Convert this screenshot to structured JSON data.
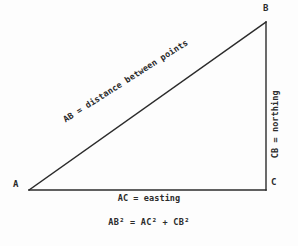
{
  "diagram": {
    "background_color": "#fdfdfd",
    "stroke_color": "#2b2b2b",
    "text_color": "#2b2b2b",
    "vertices": {
      "a": {
        "label": "A",
        "x": 29,
        "y": 190
      },
      "b": {
        "label": "B",
        "x": 266,
        "y": 22
      },
      "c": {
        "label": "C",
        "x": 266,
        "y": 190
      }
    },
    "edges": {
      "hypotenuse_label": "AB = distance between points",
      "base_label": "AC = easting",
      "vertical_label": "CB = northing"
    },
    "formula": "AB² = AC² + CB²"
  }
}
